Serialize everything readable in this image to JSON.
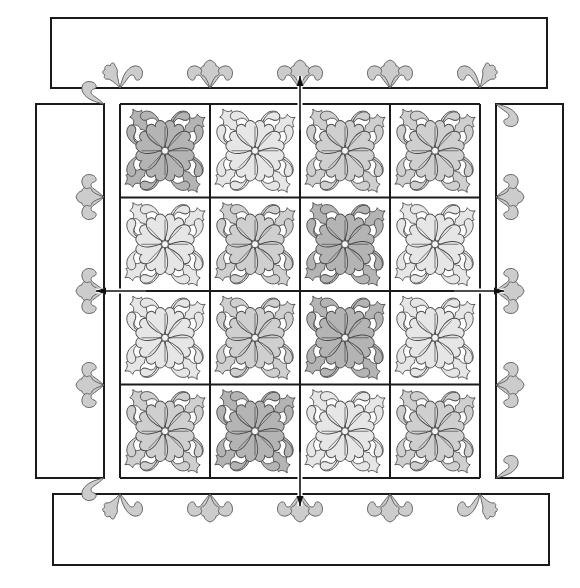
{
  "diagram": {
    "title": "Quilt assembly diagram",
    "background": "#ffffff",
    "line_color": "#1a1a1a",
    "shades": {
      "light": "#e6e6e6",
      "medium": "#cfcfcf",
      "dark": "#b4b4b4",
      "border_motif": "#cccccc"
    },
    "center": {
      "x": 120,
      "y": 104,
      "width": 360,
      "height": 374,
      "columns": 4,
      "rows": 4,
      "blocks": [
        [
          "dark",
          "light",
          "medium",
          "medium"
        ],
        [
          "light",
          "medium",
          "dark",
          "light"
        ],
        [
          "light",
          "medium",
          "dark",
          "light"
        ],
        [
          "medium",
          "dark",
          "light",
          "medium"
        ]
      ]
    },
    "borders": {
      "top": {
        "x": 51,
        "y": 18,
        "width": 496,
        "height": 70,
        "motif_edge": "bottom",
        "motif_positions": [
          120,
          210,
          300,
          390,
          480
        ],
        "motif_types": [
          "half-left",
          "full",
          "full",
          "full",
          "half-right"
        ]
      },
      "bottom": {
        "x": 53,
        "y": 494,
        "width": 496,
        "height": 71,
        "motif_edge": "top",
        "motif_positions": [
          120,
          210,
          300,
          390,
          480
        ],
        "motif_types": [
          "half-left",
          "full",
          "full",
          "full",
          "half-right"
        ]
      },
      "left": {
        "x": 36,
        "y": 104,
        "width": 68,
        "height": 374,
        "motif_edge": "right",
        "motif_positions": [
          104,
          197,
          291,
          385,
          478
        ],
        "motif_types": [
          "curl-top",
          "full",
          "full",
          "full",
          "curl-bottom"
        ]
      },
      "right": {
        "x": 496,
        "y": 104,
        "width": 67,
        "height": 374,
        "motif_edge": "left",
        "motif_positions": [
          104,
          197,
          291,
          385,
          478
        ],
        "motif_types": [
          "curl-top",
          "full",
          "full",
          "full",
          "curl-bottom"
        ]
      }
    },
    "arrows": [
      {
        "direction": "up",
        "from": [
          300,
          130
        ],
        "to": [
          300,
          76
        ]
      },
      {
        "direction": "down",
        "from": [
          300,
          452
        ],
        "to": [
          300,
          506
        ]
      },
      {
        "direction": "left",
        "from": [
          146,
          291
        ],
        "to": [
          96,
          291
        ]
      },
      {
        "direction": "right",
        "from": [
          454,
          291
        ],
        "to": [
          504,
          291
        ]
      }
    ]
  }
}
